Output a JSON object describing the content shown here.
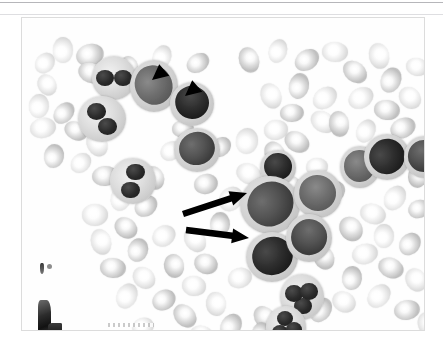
{
  "page": {
    "background_color": "#ffffff",
    "top_rule_color": "#b6b6ba",
    "second_rule_color": "#dedee1"
  },
  "figure": {
    "label": "peripheral-blood-smear-photomicrograph",
    "frame_border_color": "#dcdcdc",
    "background_color": "#fcfcfc",
    "description": "Grayscale photomicrograph of a stained peripheral blood smear showing numerous erythrocytes, several granulocytes and large mononuclear blast cells.",
    "stain_rendering": "grayscale",
    "annotations": [
      {
        "kind": "arrowhead",
        "name": "arrowhead-upper-left",
        "color": "#000000",
        "tip_x": 152,
        "tip_y": 80,
        "direction": "down-left",
        "points_to": "blast-cell-upper-left"
      },
      {
        "kind": "arrowhead",
        "name": "arrowhead-upper-right",
        "color": "#000000",
        "tip_x": 185,
        "tip_y": 96,
        "direction": "down-left",
        "points_to": "blast-cell-upper-right"
      },
      {
        "kind": "arrow",
        "name": "arrow-upper",
        "color": "#000000",
        "tail_x": 183,
        "tail_y": 214,
        "tip_x": 247,
        "tip_y": 193,
        "direction": "up-right",
        "points_to": "large-blast-cell-center"
      },
      {
        "kind": "arrow",
        "name": "arrow-lower",
        "color": "#000000",
        "tail_x": 186,
        "tail_y": 230,
        "tip_x": 249,
        "tip_y": 238,
        "direction": "right",
        "points_to": "large-blast-cell-lower-center"
      }
    ],
    "artifacts": [
      {
        "name": "edge-smudge-upper",
        "x": 18,
        "y": 245
      },
      {
        "name": "edge-smudge-lower",
        "x": 16,
        "y": 282
      },
      {
        "name": "bottom-scratch",
        "x": 86,
        "y": 305
      }
    ]
  },
  "cells": {
    "erythrocytes": [
      {
        "x": 28,
        "y": 22,
        "w": 26,
        "h": 20,
        "tone": "lt"
      },
      {
        "x": 12,
        "y": 36,
        "w": 22,
        "h": 18,
        "tone": "lt"
      },
      {
        "x": 54,
        "y": 26,
        "w": 28,
        "h": 22,
        "tone": "mid"
      },
      {
        "x": 56,
        "y": 45,
        "w": 26,
        "h": 20,
        "tone": "mid"
      },
      {
        "x": 14,
        "y": 58,
        "w": 22,
        "h": 18,
        "tone": "lt"
      },
      {
        "x": 5,
        "y": 78,
        "w": 24,
        "h": 20,
        "tone": "lt"
      },
      {
        "x": 30,
        "y": 86,
        "w": 24,
        "h": 18,
        "tone": "mid"
      },
      {
        "x": 8,
        "y": 100,
        "w": 26,
        "h": 20,
        "tone": "lt"
      },
      {
        "x": 42,
        "y": 104,
        "w": 24,
        "h": 18,
        "tone": "mid"
      },
      {
        "x": 62,
        "y": 116,
        "w": 26,
        "h": 20,
        "tone": "lt"
      },
      {
        "x": 20,
        "y": 128,
        "w": 24,
        "h": 20,
        "tone": "mid"
      },
      {
        "x": 48,
        "y": 136,
        "w": 22,
        "h": 18,
        "tone": "lt"
      },
      {
        "x": 70,
        "y": 148,
        "w": 26,
        "h": 20,
        "tone": "mid"
      },
      {
        "x": 96,
        "y": 142,
        "w": 24,
        "h": 20,
        "tone": "lt"
      },
      {
        "x": 120,
        "y": 150,
        "w": 24,
        "h": 20,
        "tone": "mid"
      },
      {
        "x": 86,
        "y": 170,
        "w": 26,
        "h": 20,
        "tone": "lt"
      },
      {
        "x": 112,
        "y": 178,
        "w": 24,
        "h": 20,
        "tone": "mid"
      },
      {
        "x": 60,
        "y": 186,
        "w": 26,
        "h": 22,
        "tone": "lt"
      },
      {
        "x": 92,
        "y": 200,
        "w": 24,
        "h": 20,
        "tone": "mid"
      },
      {
        "x": 66,
        "y": 214,
        "w": 26,
        "h": 20,
        "tone": "lt"
      },
      {
        "x": 104,
        "y": 222,
        "w": 24,
        "h": 20,
        "tone": "mid"
      },
      {
        "x": 130,
        "y": 208,
        "w": 24,
        "h": 20,
        "tone": "lt"
      },
      {
        "x": 78,
        "y": 240,
        "w": 26,
        "h": 20,
        "tone": "mid"
      },
      {
        "x": 110,
        "y": 250,
        "w": 24,
        "h": 20,
        "tone": "lt"
      },
      {
        "x": 140,
        "y": 238,
        "w": 24,
        "h": 20,
        "tone": "mid"
      },
      {
        "x": 92,
        "y": 268,
        "w": 26,
        "h": 20,
        "tone": "lt"
      },
      {
        "x": 130,
        "y": 272,
        "w": 24,
        "h": 20,
        "tone": "mid"
      },
      {
        "x": 160,
        "y": 258,
        "w": 24,
        "h": 20,
        "tone": "lt"
      },
      {
        "x": 150,
        "y": 288,
        "w": 26,
        "h": 20,
        "tone": "mid"
      },
      {
        "x": 182,
        "y": 276,
        "w": 24,
        "h": 20,
        "tone": "lt"
      },
      {
        "x": 196,
        "y": 298,
        "w": 26,
        "h": 20,
        "tone": "mid"
      },
      {
        "x": 110,
        "y": 300,
        "w": 22,
        "h": 18,
        "tone": "lt"
      },
      {
        "x": 168,
        "y": 308,
        "w": 24,
        "h": 18,
        "tone": "lt"
      },
      {
        "x": 230,
        "y": 290,
        "w": 26,
        "h": 20,
        "tone": "mid"
      },
      {
        "x": 262,
        "y": 300,
        "w": 24,
        "h": 20,
        "tone": "lt"
      },
      {
        "x": 286,
        "y": 282,
        "w": 26,
        "h": 20,
        "tone": "mid"
      },
      {
        "x": 206,
        "y": 250,
        "w": 24,
        "h": 20,
        "tone": "lt"
      },
      {
        "x": 172,
        "y": 236,
        "w": 24,
        "h": 20,
        "tone": "mid"
      },
      {
        "x": 160,
        "y": 212,
        "w": 26,
        "h": 20,
        "tone": "lt"
      },
      {
        "x": 186,
        "y": 196,
        "w": 24,
        "h": 20,
        "tone": "mid"
      },
      {
        "x": 196,
        "y": 170,
        "w": 26,
        "h": 22,
        "tone": "lt"
      },
      {
        "x": 172,
        "y": 156,
        "w": 24,
        "h": 20,
        "tone": "mid"
      },
      {
        "x": 214,
        "y": 146,
        "w": 26,
        "h": 20,
        "tone": "lt"
      },
      {
        "x": 240,
        "y": 126,
        "w": 26,
        "h": 20,
        "tone": "mid"
      },
      {
        "x": 212,
        "y": 112,
        "w": 26,
        "h": 22,
        "tone": "lt"
      },
      {
        "x": 188,
        "y": 120,
        "w": 22,
        "h": 18,
        "tone": "mid"
      },
      {
        "x": 242,
        "y": 102,
        "w": 24,
        "h": 20,
        "tone": "lt"
      },
      {
        "x": 262,
        "y": 114,
        "w": 26,
        "h": 20,
        "tone": "mid"
      },
      {
        "x": 236,
        "y": 68,
        "w": 26,
        "h": 20,
        "tone": "lt"
      },
      {
        "x": 264,
        "y": 58,
        "w": 26,
        "h": 20,
        "tone": "mid"
      },
      {
        "x": 290,
        "y": 70,
        "w": 26,
        "h": 20,
        "tone": "lt"
      },
      {
        "x": 258,
        "y": 86,
        "w": 24,
        "h": 18,
        "tone": "mid"
      },
      {
        "x": 288,
        "y": 94,
        "w": 26,
        "h": 20,
        "tone": "lt"
      },
      {
        "x": 214,
        "y": 32,
        "w": 26,
        "h": 20,
        "tone": "mid"
      },
      {
        "x": 244,
        "y": 24,
        "w": 24,
        "h": 18,
        "tone": "lt"
      },
      {
        "x": 272,
        "y": 32,
        "w": 26,
        "h": 20,
        "tone": "mid"
      },
      {
        "x": 300,
        "y": 24,
        "w": 26,
        "h": 20,
        "tone": "lt"
      },
      {
        "x": 320,
        "y": 44,
        "w": 26,
        "h": 20,
        "tone": "mid"
      },
      {
        "x": 344,
        "y": 28,
        "w": 26,
        "h": 20,
        "tone": "lt"
      },
      {
        "x": 356,
        "y": 52,
        "w": 26,
        "h": 20,
        "tone": "mid"
      },
      {
        "x": 326,
        "y": 70,
        "w": 26,
        "h": 20,
        "tone": "lt"
      },
      {
        "x": 352,
        "y": 82,
        "w": 26,
        "h": 20,
        "tone": "mid"
      },
      {
        "x": 376,
        "y": 70,
        "w": 24,
        "h": 20,
        "tone": "lt"
      },
      {
        "x": 304,
        "y": 96,
        "w": 26,
        "h": 20,
        "tone": "mid"
      },
      {
        "x": 332,
        "y": 104,
        "w": 24,
        "h": 18,
        "tone": "lt"
      },
      {
        "x": 368,
        "y": 100,
        "w": 26,
        "h": 20,
        "tone": "mid"
      },
      {
        "x": 384,
        "y": 40,
        "w": 22,
        "h": 18,
        "tone": "lt"
      },
      {
        "x": 372,
        "y": 128,
        "w": 24,
        "h": 20,
        "tone": "lt"
      },
      {
        "x": 384,
        "y": 150,
        "w": 22,
        "h": 18,
        "tone": "mid"
      },
      {
        "x": 360,
        "y": 170,
        "w": 26,
        "h": 20,
        "tone": "lt"
      },
      {
        "x": 386,
        "y": 182,
        "w": 22,
        "h": 18,
        "tone": "mid"
      },
      {
        "x": 338,
        "y": 186,
        "w": 26,
        "h": 20,
        "tone": "lt"
      },
      {
        "x": 316,
        "y": 200,
        "w": 26,
        "h": 22,
        "tone": "mid"
      },
      {
        "x": 350,
        "y": 208,
        "w": 24,
        "h": 20,
        "tone": "lt"
      },
      {
        "x": 376,
        "y": 216,
        "w": 24,
        "h": 20,
        "tone": "mid"
      },
      {
        "x": 330,
        "y": 226,
        "w": 26,
        "h": 20,
        "tone": "lt"
      },
      {
        "x": 356,
        "y": 240,
        "w": 26,
        "h": 20,
        "tone": "mid"
      },
      {
        "x": 382,
        "y": 252,
        "w": 24,
        "h": 20,
        "tone": "lt"
      },
      {
        "x": 318,
        "y": 250,
        "w": 24,
        "h": 20,
        "tone": "mid"
      },
      {
        "x": 344,
        "y": 268,
        "w": 26,
        "h": 20,
        "tone": "lt"
      },
      {
        "x": 372,
        "y": 282,
        "w": 26,
        "h": 20,
        "tone": "mid"
      },
      {
        "x": 310,
        "y": 274,
        "w": 24,
        "h": 20,
        "tone": "lt"
      },
      {
        "x": 290,
        "y": 230,
        "w": 24,
        "h": 20,
        "tone": "mid"
      },
      {
        "x": 276,
        "y": 212,
        "w": 22,
        "h": 18,
        "tone": "lt"
      },
      {
        "x": 300,
        "y": 164,
        "w": 24,
        "h": 20,
        "tone": "mid"
      },
      {
        "x": 284,
        "y": 140,
        "w": 22,
        "h": 18,
        "tone": "lt"
      },
      {
        "x": 258,
        "y": 158,
        "w": 22,
        "h": 18,
        "tone": "mid"
      },
      {
        "x": 394,
        "y": 296,
        "w": 24,
        "h": 20,
        "tone": "lt"
      },
      {
        "x": 228,
        "y": 306,
        "w": 22,
        "h": 18,
        "tone": "mid"
      },
      {
        "x": 138,
        "y": 124,
        "w": 22,
        "h": 18,
        "tone": "lt"
      },
      {
        "x": 150,
        "y": 102,
        "w": 22,
        "h": 18,
        "tone": "mid"
      },
      {
        "x": 118,
        "y": 62,
        "w": 22,
        "h": 18,
        "tone": "lt"
      },
      {
        "x": 96,
        "y": 40,
        "w": 22,
        "h": 18,
        "tone": "mid"
      },
      {
        "x": 128,
        "y": 30,
        "w": 24,
        "h": 18,
        "tone": "lt"
      },
      {
        "x": 164,
        "y": 36,
        "w": 24,
        "h": 18,
        "tone": "mid"
      }
    ],
    "leukocytes": [
      {
        "name": "granulocyte-top-left",
        "x": 70,
        "y": 38,
        "w": 44,
        "h": 44,
        "type": "granulocyte"
      },
      {
        "name": "granulocyte-left",
        "x": 56,
        "y": 78,
        "w": 48,
        "h": 46,
        "type": "granulocyte"
      },
      {
        "name": "blast-cell-upper-left",
        "x": 108,
        "y": 42,
        "w": 48,
        "h": 52,
        "type": "blast"
      },
      {
        "name": "blast-cell-upper-right",
        "x": 148,
        "y": 64,
        "w": 44,
        "h": 44,
        "type": "blast"
      },
      {
        "name": "blast-cell-mid-upper",
        "x": 152,
        "y": 110,
        "w": 46,
        "h": 44,
        "type": "blast"
      },
      {
        "name": "granulocyte-mid-left",
        "x": 88,
        "y": 140,
        "w": 46,
        "h": 46,
        "type": "granulocyte"
      },
      {
        "name": "blast-cell-center-upper",
        "x": 238,
        "y": 132,
        "w": 36,
        "h": 36,
        "type": "blast"
      },
      {
        "name": "large-blast-cell-center",
        "x": 218,
        "y": 158,
        "w": 60,
        "h": 58,
        "type": "blast"
      },
      {
        "name": "blast-cell-right-of-center",
        "x": 272,
        "y": 152,
        "w": 48,
        "h": 48,
        "type": "blast"
      },
      {
        "name": "large-blast-cell-lower-center",
        "x": 224,
        "y": 214,
        "w": 52,
        "h": 50,
        "type": "blast"
      },
      {
        "name": "blast-cell-lower-right",
        "x": 264,
        "y": 196,
        "w": 46,
        "h": 48,
        "type": "blast"
      },
      {
        "name": "blast-cell-right-a",
        "x": 318,
        "y": 128,
        "w": 40,
        "h": 42,
        "type": "blast"
      },
      {
        "name": "blast-cell-right-b",
        "x": 342,
        "y": 116,
        "w": 46,
        "h": 46,
        "type": "blast"
      },
      {
        "name": "blast-cell-right-c",
        "x": 382,
        "y": 118,
        "w": 40,
        "h": 42,
        "type": "blast"
      },
      {
        "name": "neutrophil-bottom-center",
        "x": 258,
        "y": 256,
        "w": 44,
        "h": 46,
        "type": "neutrophil"
      },
      {
        "name": "neutrophil-bottom-left",
        "x": 244,
        "y": 288,
        "w": 40,
        "h": 42,
        "type": "neutrophil"
      }
    ]
  }
}
